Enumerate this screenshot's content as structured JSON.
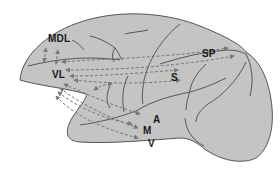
{
  "diagram": {
    "colors": {
      "brain_fill": "#c4c4c4",
      "outline": "#555555",
      "sulcus": "#4a4a4a",
      "arrow": "#777777",
      "label": "#1a1a1a"
    },
    "labels": {
      "mdl": "MDL",
      "vl": "VL",
      "sp": "SP",
      "s": "S",
      "a": "A",
      "m": "M",
      "v": "V"
    },
    "connections": [
      {
        "from": "VL",
        "to": "MDL",
        "style": "dashed-bidirectional"
      },
      {
        "from": "VL",
        "to": "SP",
        "style": "dashed-bidirectional"
      },
      {
        "from": "VL",
        "to": "S",
        "style": "dashed-bidirectional"
      },
      {
        "from": "VL",
        "to": "A",
        "style": "dashed-bidirectional"
      },
      {
        "from": "VL",
        "to": "M",
        "style": "dashed-bidirectional"
      },
      {
        "from": "VL",
        "to": "V",
        "style": "dashed-bidirectional"
      }
    ]
  }
}
